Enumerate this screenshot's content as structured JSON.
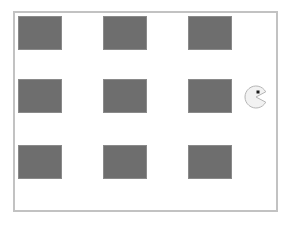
{
  "scene": {
    "title": "Pac-Man Grid",
    "width": 291,
    "height": 229,
    "background_color": "#ffffff"
  },
  "arena": {
    "name": "game-arena",
    "x": 13,
    "y": 11,
    "width": 265,
    "height": 201,
    "fill_color": "#ffffff",
    "border_color": "#c2c2c2",
    "border_width": 2
  },
  "obstacles": {
    "label": "wall-block",
    "fill_color": "#6e6e6e",
    "border_color": "#8a8a8a",
    "border_width": 1,
    "columns": 3,
    "rows": 3,
    "items": [
      {
        "id": "wall-r1c1",
        "row": 1,
        "col": 1,
        "x": 18,
        "y": 16,
        "width": 44,
        "height": 34
      },
      {
        "id": "wall-r1c2",
        "row": 1,
        "col": 2,
        "x": 103,
        "y": 16,
        "width": 44,
        "height": 34
      },
      {
        "id": "wall-r1c3",
        "row": 1,
        "col": 3,
        "x": 188,
        "y": 16,
        "width": 44,
        "height": 34
      },
      {
        "id": "wall-r2c1",
        "row": 2,
        "col": 1,
        "x": 18,
        "y": 79,
        "width": 44,
        "height": 34
      },
      {
        "id": "wall-r2c2",
        "row": 2,
        "col": 2,
        "x": 103,
        "y": 79,
        "width": 44,
        "height": 34
      },
      {
        "id": "wall-r2c3",
        "row": 2,
        "col": 3,
        "x": 188,
        "y": 79,
        "width": 44,
        "height": 34
      },
      {
        "id": "wall-r3c1",
        "row": 3,
        "col": 1,
        "x": 18,
        "y": 145,
        "width": 44,
        "height": 34
      },
      {
        "id": "wall-r3c2",
        "row": 3,
        "col": 2,
        "x": 103,
        "y": 145,
        "width": 44,
        "height": 34
      },
      {
        "id": "wall-r3c3",
        "row": 3,
        "col": 3,
        "x": 188,
        "y": 145,
        "width": 44,
        "height": 34
      }
    ]
  },
  "agent": {
    "id": "pacman",
    "label": "pacman-character",
    "x": 245,
    "y": 86,
    "center_x": 256,
    "center_y": 97,
    "radius": 11,
    "facing": "right",
    "mouth_open_degrees": 56,
    "body_color": "#f2f2f2",
    "outline_color": "#b5b5b5",
    "outline_width": 1,
    "eye": {
      "label": "pacman-eye",
      "offset_x": 2,
      "offset_y": -5,
      "size": 3,
      "color": "#1c1c1c"
    }
  }
}
